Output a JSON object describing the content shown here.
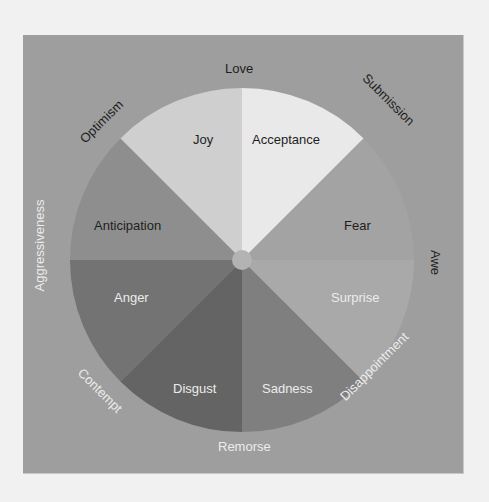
{
  "diagram": {
    "center": {
      "x": 219,
      "y": 225
    },
    "radius": 172,
    "colors": {
      "background": "#f1f1f1",
      "panel": "#9e9e9e",
      "hub": "#b3b3b3"
    },
    "primary_emotions": [
      {
        "label": "Joy",
        "color": "#cfcfcf",
        "text_tone": "dark"
      },
      {
        "label": "Acceptance",
        "color": "#e9e9e9",
        "text_tone": "dark"
      },
      {
        "label": "Fear",
        "color": "#a2a2a2",
        "text_tone": "dark"
      },
      {
        "label": "Surprise",
        "color": "#a9a9a9",
        "text_tone": "light"
      },
      {
        "label": "Sadness",
        "color": "#7f7f7f",
        "text_tone": "light"
      },
      {
        "label": "Disgust",
        "color": "#646464",
        "text_tone": "light"
      },
      {
        "label": "Anger",
        "color": "#737373",
        "text_tone": "light"
      },
      {
        "label": "Anticipation",
        "color": "#8e8e8e",
        "text_tone": "dark"
      }
    ],
    "dyads": [
      {
        "label": "Love",
        "text_tone": "dark"
      },
      {
        "label": "Submission",
        "text_tone": "dark"
      },
      {
        "label": "Awe",
        "text_tone": "dark"
      },
      {
        "label": "Disappointment",
        "text_tone": "light"
      },
      {
        "label": "Remorse",
        "text_tone": "light"
      },
      {
        "label": "Contempt",
        "text_tone": "light"
      },
      {
        "label": "Aggressiveness",
        "text_tone": "light"
      },
      {
        "label": "Optimism",
        "text_tone": "dark"
      }
    ]
  }
}
